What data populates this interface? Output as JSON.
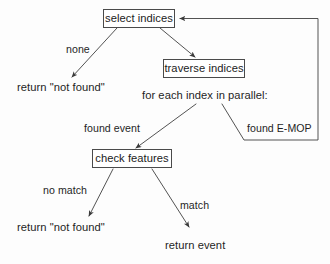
{
  "diagram": {
    "line_color": "#4a4a4a",
    "text_color": "#1f1f1f",
    "background": "#fdfdfd",
    "nodes": [
      {
        "id": "select_indices",
        "label": "select indices"
      },
      {
        "id": "traverse_indices",
        "label": "traverse indices"
      },
      {
        "id": "check_features",
        "label": "check features"
      }
    ],
    "free_text": [
      {
        "id": "return_not_found_top",
        "label": "return \"not found\""
      },
      {
        "id": "for_each_index",
        "label": "for each index in parallel:"
      },
      {
        "id": "return_not_found_bottom",
        "label": "return \"not found\""
      },
      {
        "id": "return_event",
        "label": "return event"
      }
    ],
    "edge_labels": [
      {
        "id": "none",
        "label": "none"
      },
      {
        "id": "found_event",
        "label": "found event"
      },
      {
        "id": "found_emop",
        "label": "found E-MOP"
      },
      {
        "id": "no_match",
        "label": "no match"
      },
      {
        "id": "match",
        "label": "match"
      }
    ],
    "edges": [
      {
        "id": "select-to-return-not-found",
        "from": "select indices",
        "to": "return \"not found\"",
        "label": "none"
      },
      {
        "id": "select-to-traverse",
        "from": "select indices",
        "to": "traverse indices",
        "label": ""
      },
      {
        "id": "parallel-to-check",
        "from": "for each index in parallel:",
        "to": "check features",
        "label": "found event"
      },
      {
        "id": "parallel-to-loop",
        "from": "for each index in parallel:",
        "to": "select indices",
        "label": "found E-MOP"
      },
      {
        "id": "check-to-return-not-found",
        "from": "check features",
        "to": "return \"not found\"",
        "label": "no match"
      },
      {
        "id": "check-to-return-event",
        "from": "check features",
        "to": "return event",
        "label": "match"
      }
    ],
    "caption_fragment": " "
  }
}
